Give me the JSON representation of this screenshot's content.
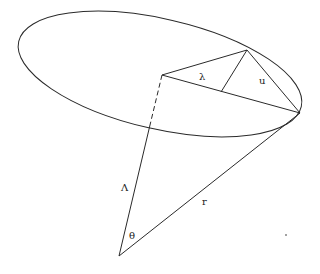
{
  "diagram": {
    "labels": {
      "lambda_small": "λ",
      "u": "u",
      "lambda_capital": "Λ",
      "r": "r",
      "theta": "θ"
    },
    "colors": {
      "stroke": "#2a2a2a",
      "background": "#ffffff"
    }
  }
}
